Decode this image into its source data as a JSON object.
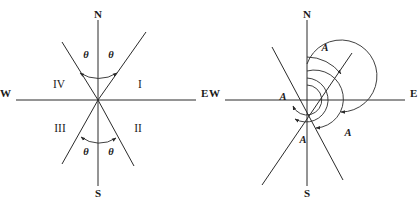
{
  "figure": {
    "background_color": "#ffffff",
    "stroke_color": "#2a2a2a",
    "panels": [
      {
        "id": "left-panel",
        "name": "quadrant-bearing-diagram",
        "center": {
          "x": 98,
          "y": 100
        },
        "compass": {
          "north": "N",
          "south": "S",
          "east": "E",
          "west": "W"
        },
        "quadrants": [
          {
            "id": "q1",
            "label": "I",
            "x": 140,
            "y": 88
          },
          {
            "id": "q2",
            "label": "II",
            "x": 138,
            "y": 132
          },
          {
            "id": "q3",
            "label": "III",
            "x": 60,
            "y": 132
          },
          {
            "id": "q4",
            "label": "IV",
            "x": 59,
            "y": 88
          }
        ],
        "angles": [
          {
            "id": "theta-ne",
            "label": "θ",
            "x": 86,
            "y": 58
          },
          {
            "id": "theta-nw",
            "label": "θ",
            "x": 110,
            "y": 58
          },
          {
            "id": "theta-sw",
            "label": "θ",
            "x": 86,
            "y": 152
          },
          {
            "id": "theta-se",
            "label": "θ",
            "x": 110,
            "y": 152
          }
        ]
      },
      {
        "id": "right-panel",
        "name": "azimuth-bearing-diagram",
        "center": {
          "x": 307,
          "y": 100
        },
        "compass": {
          "north": "N",
          "south": "S",
          "east": "E",
          "west": "W"
        },
        "angles": [
          {
            "id": "a-ne",
            "label": "A",
            "x": 325,
            "y": 48
          },
          {
            "id": "a-w",
            "label": "A",
            "x": 283,
            "y": 97
          },
          {
            "id": "a-sw",
            "label": "A",
            "x": 305,
            "y": 140
          },
          {
            "id": "a-se",
            "label": "A",
            "x": 348,
            "y": 133
          }
        ]
      }
    ]
  }
}
